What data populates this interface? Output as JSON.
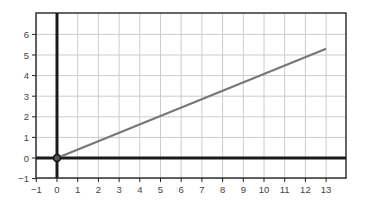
{
  "chart_data": {
    "type": "line",
    "title": "",
    "xlabel": "",
    "ylabel": "",
    "xlim": [
      -1,
      14
    ],
    "ylim": [
      -1,
      7
    ],
    "x_ticks": [
      -1,
      0,
      1,
      2,
      3,
      4,
      5,
      6,
      7,
      8,
      9,
      10,
      11,
      12,
      13
    ],
    "y_ticks": [
      -1,
      0,
      1,
      2,
      3,
      4,
      5,
      6
    ],
    "x_tick_labels": [
      "−1",
      "0",
      "1",
      "2",
      "3",
      "4",
      "5",
      "6",
      "7",
      "8",
      "9",
      "10",
      "11",
      "12",
      "13"
    ],
    "y_tick_labels": [
      "−1",
      "0",
      "1",
      "2",
      "3",
      "4",
      "5",
      "6"
    ],
    "grid": true,
    "legend": null,
    "series": [
      {
        "name": "line",
        "x": [
          0,
          13
        ],
        "y": [
          0,
          5.3
        ],
        "color": "#777777"
      }
    ],
    "points": [
      {
        "x": 0,
        "y": 0,
        "label": "origin"
      }
    ],
    "colors": {
      "grid": "#cccccc",
      "axes": "#1a1a1a",
      "frame": "#333333",
      "line": "#777777"
    }
  }
}
